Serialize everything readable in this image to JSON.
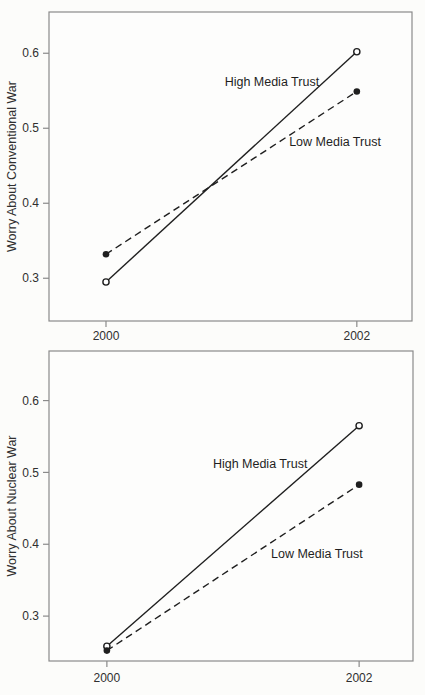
{
  "figure": {
    "background": "#fcfcfa"
  },
  "chart_data": [
    {
      "type": "line",
      "title": "",
      "xlabel": "",
      "ylabel": "Worry About Conventional War",
      "categories": [
        "2000",
        "2002"
      ],
      "x_values": [
        2000,
        2002
      ],
      "yticks_display": [
        "0.3",
        "0.4",
        "0.5",
        "0.6"
      ],
      "ytick_values": [
        0.3,
        0.4,
        0.5,
        0.6
      ],
      "ylim": [
        0.243,
        0.655
      ],
      "grid": false,
      "legend_position": "inline-annotation",
      "x_frac": [
        0.157,
        0.848
      ],
      "series": [
        {
          "name": "High Media Trust",
          "values": [
            0.295,
            0.602
          ],
          "line_style": "solid",
          "marker": "open-circle",
          "label_frac": [
            0.614,
            0.225
          ]
        },
        {
          "name": "Low Media Trust",
          "values": [
            0.332,
            0.549
          ],
          "line_style": "dashed",
          "marker": "filled-circle",
          "label_frac": [
            0.788,
            0.421
          ]
        }
      ],
      "colors": {
        "line": "#1f1f1f",
        "frame": "#8a8a8a",
        "text": "#2f2f2f",
        "plot_bg": "#fdfdfc",
        "marker_open_fill": "#ffffff"
      }
    },
    {
      "type": "line",
      "title": "",
      "xlabel": "",
      "ylabel": "Worry About Nuclear War",
      "categories": [
        "2000",
        "2002"
      ],
      "x_values": [
        2000,
        2002
      ],
      "yticks_display": [
        "0.3",
        "0.4",
        "0.5",
        "0.6"
      ],
      "ytick_values": [
        0.3,
        0.4,
        0.5,
        0.6
      ],
      "ylim": [
        0.2375,
        0.669
      ],
      "grid": false,
      "legend_position": "inline-annotation",
      "x_frac": [
        0.159,
        0.852
      ],
      "series": [
        {
          "name": "High Media Trust",
          "values": [
            0.258,
            0.565
          ],
          "line_style": "solid",
          "marker": "open-circle",
          "label_frac": [
            0.58,
            0.363
          ]
        },
        {
          "name": "Low Media Trust",
          "values": [
            0.252,
            0.483
          ],
          "line_style": "dashed",
          "marker": "filled-circle",
          "label_frac": [
            0.736,
            0.653
          ]
        }
      ],
      "colors": {
        "line": "#1f1f1f",
        "frame": "#8a8a8a",
        "text": "#2f2f2f",
        "plot_bg": "#fdfdfc",
        "marker_open_fill": "#ffffff"
      }
    }
  ]
}
